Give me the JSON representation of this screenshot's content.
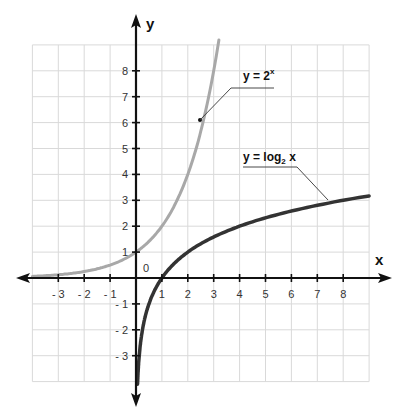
{
  "chart_data": {
    "type": "line",
    "title": "",
    "xlabel": "x",
    "ylabel": "y",
    "xlim": [
      -4,
      9
    ],
    "ylim": [
      -4,
      9
    ],
    "grid": true,
    "origin_label": "0",
    "x_ticks": [
      -3,
      -2,
      -1,
      1,
      2,
      3,
      4,
      5,
      6,
      7,
      8
    ],
    "x_tick_labels": [
      "- 3",
      "- 2",
      "- 1",
      "1",
      "2",
      "3",
      "4",
      "5",
      "6",
      "7",
      "8"
    ],
    "y_ticks": [
      -3,
      -2,
      -1,
      1,
      2,
      3,
      4,
      5,
      6,
      7,
      8
    ],
    "y_tick_labels": [
      "- 3",
      "- 2",
      "- 1",
      "1",
      "2",
      "3",
      "4",
      "5",
      "6",
      "7",
      "8"
    ],
    "series": [
      {
        "name": "y = 2^x",
        "label_main": "y = 2",
        "label_sup": "x",
        "color": "#a8a8a8",
        "function": "2^x",
        "x": [
          -4,
          -3,
          -2,
          -1,
          0,
          1,
          2,
          2.5,
          3,
          3.17
        ],
        "y": [
          0.0625,
          0.125,
          0.25,
          0.5,
          1,
          2,
          4,
          5.66,
          8,
          9
        ]
      },
      {
        "name": "y = log2 x",
        "label_main": "y = log",
        "label_sub": "2",
        "label_tail": " x",
        "color": "#333333",
        "function": "log2(x)",
        "x": [
          0.0625,
          0.125,
          0.25,
          0.5,
          1,
          2,
          4,
          8,
          9
        ],
        "y": [
          -4,
          -3,
          -2,
          -1,
          0,
          1,
          2,
          3,
          3.17
        ]
      }
    ],
    "annotations": [
      {
        "series": "y = 2^x",
        "point": [
          2.5,
          5.66
        ]
      },
      {
        "series": "y = log2 x",
        "point": [
          7.5,
          2.91
        ]
      }
    ]
  },
  "labels": {
    "x_axis": "x",
    "y_axis": "y",
    "origin": "0",
    "eq1_main": "y = 2",
    "eq1_sup": "x",
    "eq2_main": "y = log",
    "eq2_sub": "2",
    "eq2_tail": " x"
  },
  "colors": {
    "grid": "#d9d9d9",
    "axis": "#111111",
    "exp_curve": "#a8a8a8",
    "log_curve": "#333333"
  }
}
